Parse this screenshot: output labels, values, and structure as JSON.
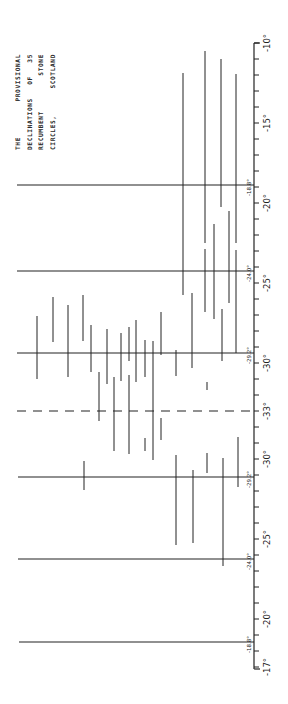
{
  "chart_data": {
    "type": "range",
    "title": "THE PROVISIONAL DECLINATIONS OF 35 RECUMBENT STONE CIRCLES, SCOTLAND",
    "title_lines": [
      [
        "THE",
        "PROVISIONAL"
      ],
      [
        "DECLINATIONS",
        "OF",
        "35"
      ],
      [
        "RECUMBENT",
        "STONE"
      ],
      [
        "CIRCLES,",
        "SCOTLAND"
      ]
    ],
    "orientation": "vertical axis on right; scale folds at -33°",
    "axis": {
      "x": 254,
      "y_top": 43,
      "y_bottom": 669,
      "px_per_degree": 16,
      "fold_value": -33,
      "ticks_upper": [
        -10,
        -11,
        -12,
        -13,
        -14,
        -15,
        -16,
        -17,
        -18,
        -19,
        -20,
        -21,
        -22,
        -23,
        -24,
        -25,
        -26,
        -27,
        -28,
        -29,
        -30,
        -31,
        -32,
        -33
      ],
      "ticks_lower": [
        -32,
        -31,
        -30,
        -29,
        -28,
        -27,
        -26,
        -25,
        -24,
        -23,
        -22,
        -21,
        -20,
        -19,
        -18,
        -17
      ],
      "labels_upper": [
        {
          "text": "-10°",
          "value": -10
        },
        {
          "text": "-15°",
          "value": -15
        },
        {
          "text": "-20°",
          "value": -20
        },
        {
          "text": "-25°",
          "value": -25
        },
        {
          "text": "-30°",
          "value": -30
        },
        {
          "text": "-33°",
          "value": -33
        }
      ],
      "labels_lower": [
        {
          "text": "-30°",
          "value": -30
        },
        {
          "text": "-25°",
          "value": -25
        },
        {
          "text": "-20°",
          "value": -20
        },
        {
          "text": "-17°",
          "value": -17
        }
      ]
    },
    "reference_lines": [
      {
        "label": "-18.8°",
        "y": 185,
        "x_start": 17,
        "style": "solid"
      },
      {
        "label": "-24.0°",
        "y": 271,
        "x_start": 17,
        "style": "solid"
      },
      {
        "label": "-29.2°",
        "y": 353,
        "x_start": 17,
        "style": "solid"
      },
      {
        "label": "",
        "y": 411,
        "x_start": 17,
        "style": "dashed",
        "value": "-33°"
      },
      {
        "label": "-29.2°",
        "y": 477,
        "x_start": 18,
        "style": "solid"
      },
      {
        "label": "-24.0°",
        "y": 559,
        "x_start": 18,
        "style": "solid"
      },
      {
        "label": "-18.8°",
        "y": 642,
        "x_start": 19,
        "style": "solid"
      }
    ],
    "segments": [
      {
        "x": 183,
        "y1": 73,
        "y2": 295
      },
      {
        "x": 205,
        "y1": 51,
        "y2": 243
      },
      {
        "x": 205,
        "y1": 249,
        "y2": 312
      },
      {
        "x": 221,
        "y1": 59,
        "y2": 207
      },
      {
        "x": 236,
        "y1": 74,
        "y2": 243
      },
      {
        "x": 236,
        "y1": 250,
        "y2": 353
      },
      {
        "x": 229,
        "y1": 211,
        "y2": 303
      },
      {
        "x": 214,
        "y1": 224,
        "y2": 319
      },
      {
        "x": 192,
        "y1": 293,
        "y2": 368
      },
      {
        "x": 222,
        "y1": 309,
        "y2": 361
      },
      {
        "x": 37,
        "y1": 316,
        "y2": 379
      },
      {
        "x": 53,
        "y1": 297,
        "y2": 342
      },
      {
        "x": 68,
        "y1": 305,
        "y2": 377
      },
      {
        "x": 83,
        "y1": 295,
        "y2": 341
      },
      {
        "x": 91,
        "y1": 325,
        "y2": 372
      },
      {
        "x": 107,
        "y1": 329,
        "y2": 384
      },
      {
        "x": 121,
        "y1": 333,
        "y2": 381
      },
      {
        "x": 129,
        "y1": 327,
        "y2": 361
      },
      {
        "x": 136,
        "y1": 320,
        "y2": 382
      },
      {
        "x": 145,
        "y1": 340,
        "y2": 377
      },
      {
        "x": 153,
        "y1": 341,
        "y2": 460
      },
      {
        "x": 161,
        "y1": 312,
        "y2": 355
      },
      {
        "x": 176,
        "y1": 350,
        "y2": 376
      },
      {
        "x": 99,
        "y1": 372,
        "y2": 421
      },
      {
        "x": 114,
        "y1": 377,
        "y2": 451
      },
      {
        "x": 129,
        "y1": 375,
        "y2": 454
      },
      {
        "x": 145,
        "y1": 438,
        "y2": 451
      },
      {
        "x": 161,
        "y1": 418,
        "y2": 440
      },
      {
        "x": 207,
        "y1": 382,
        "y2": 390
      },
      {
        "x": 84,
        "y1": 461,
        "y2": 490
      },
      {
        "x": 176,
        "y1": 455,
        "y2": 545
      },
      {
        "x": 193,
        "y1": 470,
        "y2": 543
      },
      {
        "x": 207,
        "y1": 453,
        "y2": 473
      },
      {
        "x": 223,
        "y1": 458,
        "y2": 566
      },
      {
        "x": 238,
        "y1": 437,
        "y2": 487
      }
    ],
    "colors": {
      "ink": "#222222",
      "background": "#ffffff"
    }
  }
}
